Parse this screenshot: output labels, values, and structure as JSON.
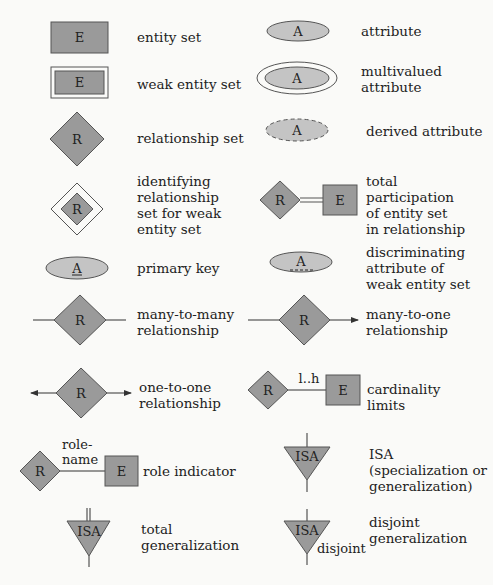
{
  "colors": {
    "fill": "#9a9a9a",
    "stroke": "#555555",
    "background": "#fafaf8",
    "text": "#222222"
  },
  "symbols": {
    "entity": "E",
    "attribute": "A",
    "relationship": "R",
    "isa": "ISA"
  },
  "legend": [
    {
      "id": "entity-set",
      "label": "entity set"
    },
    {
      "id": "weak-entity-set",
      "label": "weak entity set"
    },
    {
      "id": "relationship-set",
      "label": "relationship set"
    },
    {
      "id": "identifying-relationship",
      "label": "identifying\nrelationship\nset for weak\nentity set"
    },
    {
      "id": "primary-key",
      "label": "primary key"
    },
    {
      "id": "many-to-many",
      "label": "many-to-many\nrelationship"
    },
    {
      "id": "one-to-one",
      "label": "one-to-one\nrelationship"
    },
    {
      "id": "role-indicator",
      "label": "role indicator"
    },
    {
      "id": "total-generalization",
      "label": "total\ngeneralization"
    },
    {
      "id": "attribute",
      "label": "attribute"
    },
    {
      "id": "multivalued-attribute",
      "label": "multivalued\nattribute"
    },
    {
      "id": "derived-attribute",
      "label": "derived attribute"
    },
    {
      "id": "total-participation",
      "label": "total\nparticipation\nof entity set\nin relationship"
    },
    {
      "id": "discriminating-attribute",
      "label": "discriminating\nattribute of\nweak entity set"
    },
    {
      "id": "many-to-one",
      "label": "many-to-one\nrelationship"
    },
    {
      "id": "cardinality-limits",
      "label": "cardinality\nlimits"
    },
    {
      "id": "isa",
      "label": "ISA\n(specialization or\ngeneralization)"
    },
    {
      "id": "disjoint-generalization",
      "label": "disjoint\ngeneralization"
    }
  ],
  "annotations": {
    "cardinality": "l..h",
    "role_name": "role-\nname",
    "disjoint": "disjoint"
  }
}
